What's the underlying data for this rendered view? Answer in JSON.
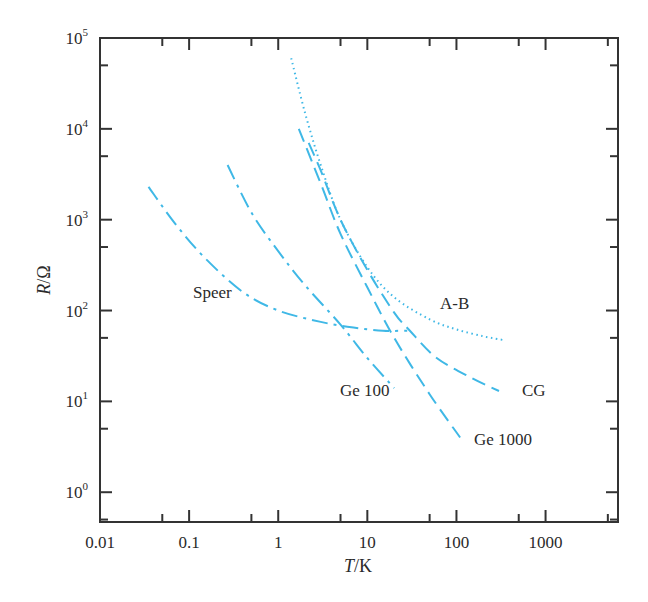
{
  "chart_data": {
    "type": "line",
    "title": "",
    "xlabel": "T/K",
    "ylabel": "R/Ω",
    "xscale": "log",
    "yscale": "log",
    "xlim": [
      0.01,
      6500
    ],
    "ylim": [
      0.47,
      100000
    ],
    "grid": false,
    "legend": "inline labels",
    "x_ticks": [
      0.01,
      0.1,
      1,
      10,
      100,
      1000
    ],
    "x_tick_labels": [
      "0.01",
      "0.1",
      "1",
      "10",
      "100",
      "1000"
    ],
    "y_ticks": [
      1,
      10,
      100,
      1000,
      10000,
      100000
    ],
    "y_tick_labels": [
      {
        "base": "10",
        "exp": "0"
      },
      {
        "base": "10",
        "exp": "1"
      },
      {
        "base": "10",
        "exp": "2"
      },
      {
        "base": "10",
        "exp": "3"
      },
      {
        "base": "10",
        "exp": "4"
      },
      {
        "base": "10",
        "exp": "5"
      }
    ],
    "series": [
      {
        "name": "A-B",
        "style": "dotted",
        "color": "#3fb8e6",
        "label_pos": [
          440,
          309
        ],
        "points": [
          [
            1.4,
            60000
          ],
          [
            2,
            15000
          ],
          [
            3,
            4000
          ],
          [
            5,
            1000
          ],
          [
            10,
            300
          ],
          [
            20,
            140
          ],
          [
            50,
            80
          ],
          [
            100,
            62
          ],
          [
            200,
            52
          ],
          [
            350,
            47
          ]
        ]
      },
      {
        "name": "Ge 1000",
        "style": "long-dash",
        "color": "#3fb8e6",
        "label_pos": [
          474,
          445
        ],
        "points": [
          [
            1.7,
            10000
          ],
          [
            3,
            2500
          ],
          [
            5,
            700
          ],
          [
            10,
            180
          ],
          [
            20,
            50
          ],
          [
            50,
            12
          ],
          [
            110,
            4
          ]
        ]
      },
      {
        "name": "CG",
        "style": "long-dash",
        "color": "#3fb8e6",
        "label_pos": [
          522,
          396
        ],
        "points": [
          [
            2.2,
            7000
          ],
          [
            3,
            3500
          ],
          [
            5,
            1000
          ],
          [
            10,
            280
          ],
          [
            20,
            95
          ],
          [
            30,
            60
          ],
          [
            60,
            30
          ],
          [
            150,
            18
          ],
          [
            300,
            13
          ]
        ]
      },
      {
        "name": "Ge 100",
        "style": "dash-dot",
        "color": "#3fb8e6",
        "label_pos": [
          340,
          396
        ],
        "points": [
          [
            0.27,
            4000
          ],
          [
            0.5,
            1200
          ],
          [
            1,
            450
          ],
          [
            2,
            190
          ],
          [
            5,
            70
          ],
          [
            10,
            30
          ],
          [
            20,
            14
          ]
        ]
      },
      {
        "name": "Speer",
        "style": "dash-dot",
        "color": "#3fb8e6",
        "label_pos": [
          193,
          298
        ],
        "points": [
          [
            0.035,
            2300
          ],
          [
            0.07,
            900
          ],
          [
            0.15,
            380
          ],
          [
            0.4,
            160
          ],
          [
            1,
            100
          ],
          [
            3,
            75
          ],
          [
            7,
            65
          ],
          [
            15,
            60
          ],
          [
            28,
            60
          ]
        ]
      }
    ]
  },
  "axis": {
    "x_title_italic": "T",
    "x_title_rest": "/K",
    "y_title_italic": "R",
    "y_title_rest": "/Ω"
  }
}
